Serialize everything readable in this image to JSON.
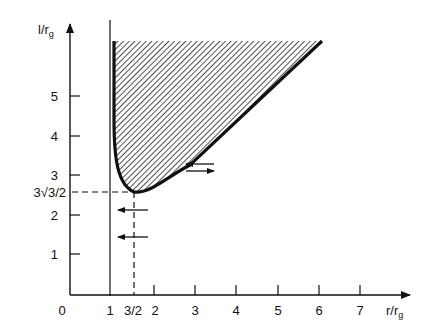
{
  "diagram": {
    "y_axis_label": "l/r",
    "y_axis_subscript": "g",
    "x_axis_label": "r/r",
    "x_axis_subscript": "g",
    "origin_label": "0",
    "x_ticks": [
      {
        "label": "1",
        "value": 1
      },
      {
        "label": "3/2",
        "value": 1.5
      },
      {
        "label": "2",
        "value": 2
      },
      {
        "label": "3",
        "value": 3
      },
      {
        "label": "4",
        "value": 4
      },
      {
        "label": "5",
        "value": 5
      },
      {
        "label": "6",
        "value": 6
      },
      {
        "label": "7",
        "value": 7
      }
    ],
    "y_ticks": [
      {
        "label": "1",
        "value": 1
      },
      {
        "label": "2",
        "value": 2
      },
      {
        "label": "3",
        "value": 3
      },
      {
        "label": "4",
        "value": 4
      },
      {
        "label": "5",
        "value": 5
      }
    ],
    "special_y_label": "3√3/2",
    "special_y_value": 2.598,
    "vertical_line_at_x": 1,
    "minimum_point": {
      "x": 1.5,
      "y": 2.598
    },
    "shaded_region": "hatched region above the effective potential curve",
    "arrows": [
      {
        "direction": "left",
        "x": 1.6,
        "y": 2.1
      },
      {
        "direction": "left",
        "x": 1.6,
        "y": 1.5
      },
      {
        "direction": "left",
        "x": 3.2,
        "y": 3.2
      },
      {
        "direction": "right",
        "x": 3.2,
        "y": 3.05
      }
    ],
    "colors": {
      "ink": "#111111",
      "background": "#ffffff"
    }
  }
}
